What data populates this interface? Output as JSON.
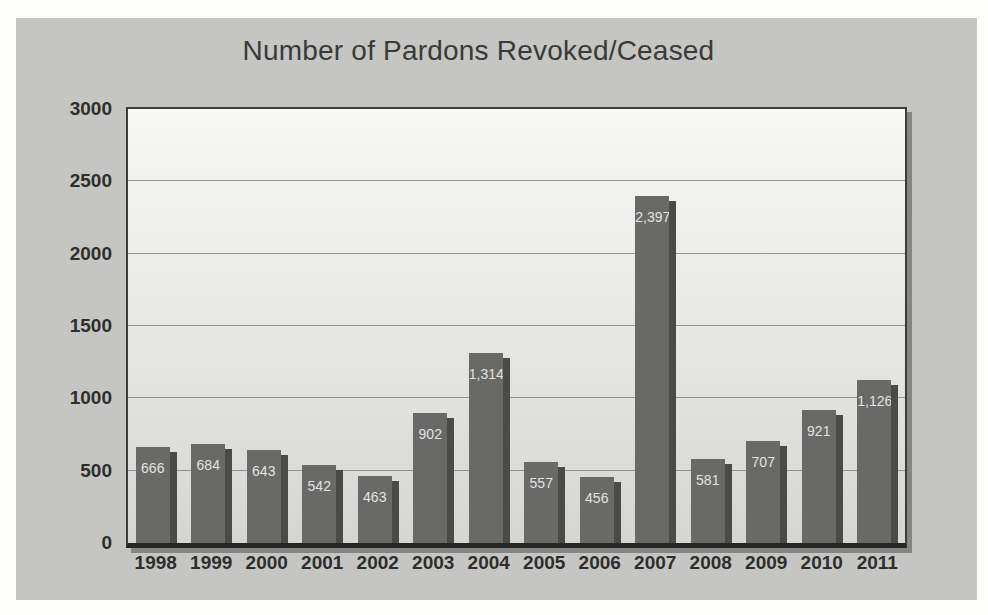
{
  "chart_data": {
    "type": "bar",
    "title": "Number of Pardons Revoked/Ceased",
    "categories": [
      "1998",
      "1999",
      "2000",
      "2001",
      "2002",
      "2003",
      "2004",
      "2005",
      "2006",
      "2007",
      "2008",
      "2009",
      "2010",
      "2011"
    ],
    "values": [
      666,
      684,
      643,
      542,
      463,
      902,
      1314,
      557,
      456,
      2397,
      581,
      707,
      921,
      1126
    ],
    "value_labels": [
      "666",
      "684",
      "643",
      "542",
      "463",
      "902",
      "1,314",
      "557",
      "456",
      "2,397",
      "581",
      "707",
      "921",
      "1,126"
    ],
    "xlabel": "",
    "ylabel": "",
    "ylim": [
      0,
      3000
    ],
    "yticks": [
      "0",
      "500",
      "1000",
      "1500",
      "2000",
      "2500",
      "3000"
    ],
    "ytick_values": [
      0,
      500,
      1000,
      1500,
      2000,
      2500,
      3000
    ],
    "grid": "horizontal",
    "legend": "none",
    "colors": {
      "bar": "#696967",
      "bar_shadow": "#4a4a48",
      "data_label_text": "#e2e2e0",
      "chart_background": "#c5c5c3",
      "plot_background_top": "#f7f7f5",
      "plot_background_bottom": "#d5d5d3",
      "gridline": "#929290",
      "axis_text": "#2e2e2c",
      "title_text": "#3a3a38"
    }
  }
}
